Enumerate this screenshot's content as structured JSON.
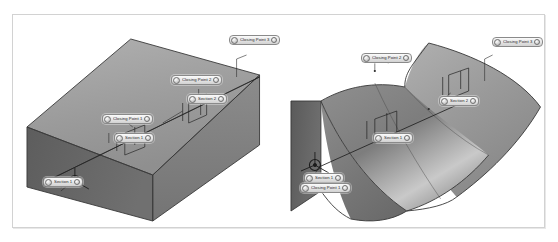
{
  "figure": {
    "frame_border_color": "#d2d2d2",
    "background_color": "#ffffff"
  },
  "palette": {
    "surface_light": "#a8a8a8",
    "surface_mid": "#8e8e8e",
    "surface_dark": "#6e6e6e",
    "surface_darkest": "#565656",
    "edge_color": "#2f2f2f",
    "highlight_color": "#e6e6e6",
    "label_border": "#8a8a8a",
    "label_text": "#1d1d1d"
  },
  "viewports": [
    {
      "name": "left-viewport",
      "model": "straight-loft-box",
      "description": "Rectangular prism loft between two profile sections",
      "triad": {
        "name": "origin-triad",
        "axes": [
          "X",
          "Y",
          "Z"
        ]
      },
      "callouts": [
        {
          "id": "l-closing-point-3",
          "label": "Closing Point 3",
          "x": 228,
          "y": 34
        },
        {
          "id": "l-closing-point-2",
          "label": "Closing Point 2",
          "x": 170,
          "y": 74
        },
        {
          "id": "l-section-2",
          "label": "Section 2",
          "x": 186,
          "y": 93
        },
        {
          "id": "l-closing-point-1",
          "label": "Closing Point 1",
          "x": 101,
          "y": 113
        },
        {
          "id": "l-section-1",
          "label": "Section 1",
          "x": 113,
          "y": 132
        },
        {
          "id": "l-section-origin",
          "label": "Section 1",
          "x": 42,
          "y": 176
        }
      ]
    },
    {
      "name": "right-viewport",
      "model": "curved-loft-surface",
      "description": "Loft with guide curves producing an undulating swept surface",
      "triad": {
        "name": "origin-triad",
        "axes": [
          "X",
          "Y",
          "Z"
        ]
      },
      "callouts": [
        {
          "id": "r-closing-point-3",
          "label": "Closing Point 3",
          "x": 491,
          "y": 36
        },
        {
          "id": "r-closing-point-2",
          "label": "Closing Point 2",
          "x": 360,
          "y": 52
        },
        {
          "id": "r-section-2",
          "label": "Section 2",
          "x": 438,
          "y": 95
        },
        {
          "id": "r-section-1",
          "label": "Section 1",
          "x": 372,
          "y": 132
        },
        {
          "id": "r-section-0",
          "label": "Section 1",
          "x": 303,
          "y": 172
        },
        {
          "id": "r-closing-point-1",
          "label": "Closing Point 1",
          "x": 299,
          "y": 182
        }
      ]
    }
  ]
}
